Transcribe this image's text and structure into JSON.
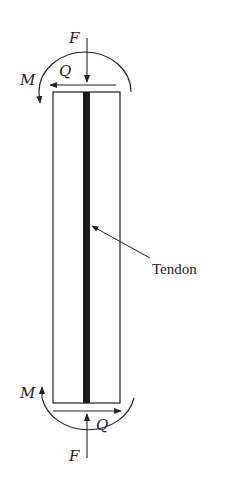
{
  "diagram": {
    "member": {
      "left": 53,
      "right": 120,
      "top": 92,
      "bottom": 403
    },
    "tendon": {
      "x": 83,
      "width": 7,
      "label": "Tendon"
    },
    "top_loads": {
      "axial": "F",
      "shear": "Q",
      "moment": "M"
    },
    "bottom_loads": {
      "axial": "F",
      "shear": "Q",
      "moment": "M"
    },
    "colors": {
      "stroke": "#222222",
      "tendon": "#1a1a1a",
      "background": "#ffffff"
    }
  }
}
